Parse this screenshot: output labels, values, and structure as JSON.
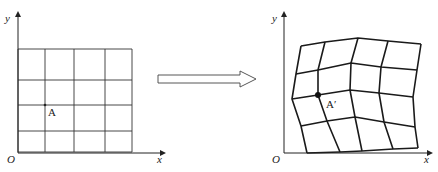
{
  "left_panel": {
    "axis_x_label": "x",
    "axis_y_label": "y",
    "origin_label": "O",
    "point_label": "A",
    "grid": {
      "cols_x": [
        18,
        45,
        74,
        105,
        132
      ],
      "rows_y": [
        49,
        80,
        105,
        131,
        152
      ]
    },
    "point": [
      45,
      105
    ]
  },
  "arrow": {
    "direction": "right",
    "meaning": "transformation"
  },
  "right_panel": {
    "axis_x_label": "x",
    "axis_y_label": "y",
    "origin_label": "O",
    "point_label": "A′",
    "deformed_grid": [
      [
        [
          301,
          46
        ],
        [
          325,
          42
        ],
        [
          358,
          38
        ],
        [
          388,
          41
        ],
        [
          421,
          44
        ]
      ],
      [
        [
          296,
          74
        ],
        [
          318,
          70
        ],
        [
          351,
          63
        ],
        [
          381,
          67
        ],
        [
          417,
          70
        ]
      ],
      [
        [
          292,
          99
        ],
        [
          318,
          95
        ],
        [
          350,
          90
        ],
        [
          379,
          93
        ],
        [
          413,
          97
        ]
      ],
      [
        [
          301,
          126
        ],
        [
          327,
          121
        ],
        [
          355,
          117
        ],
        [
          384,
          122
        ],
        [
          415,
          127
        ]
      ],
      [
        [
          307,
          153
        ],
        [
          340,
          152
        ],
        [
          362,
          151
        ],
        [
          393,
          149
        ],
        [
          418,
          148
        ]
      ]
    ],
    "point": [
      318,
      95
    ]
  },
  "colors": {
    "line": "#222222",
    "background": "#ffffff"
  }
}
